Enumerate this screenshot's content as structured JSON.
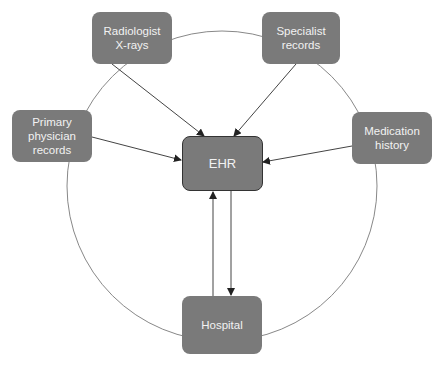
{
  "diagram": {
    "center": {
      "label": "EHR"
    },
    "nodes": [
      {
        "id": "radiologist",
        "label": "Radiologist\nX-rays"
      },
      {
        "id": "specialist",
        "label": "Specialist\nrecords"
      },
      {
        "id": "primary",
        "label": "Primary\nphysician\nrecords"
      },
      {
        "id": "medication",
        "label": "Medication\nhistory"
      },
      {
        "id": "hospital",
        "label": "Hospital"
      }
    ],
    "edges": [
      {
        "from": "radiologist",
        "to": "EHR",
        "direction": "one-way"
      },
      {
        "from": "specialist",
        "to": "EHR",
        "direction": "one-way"
      },
      {
        "from": "primary",
        "to": "EHR",
        "direction": "one-way"
      },
      {
        "from": "medication",
        "to": "EHR",
        "direction": "one-way"
      },
      {
        "from": "hospital",
        "to": "EHR",
        "direction": "one-way"
      },
      {
        "from": "EHR",
        "to": "hospital",
        "direction": "one-way"
      }
    ],
    "colors": {
      "node_fill": "#7a7a7a",
      "node_text": "#f2f2f2",
      "line": "#444444",
      "circle": "#888888"
    }
  }
}
